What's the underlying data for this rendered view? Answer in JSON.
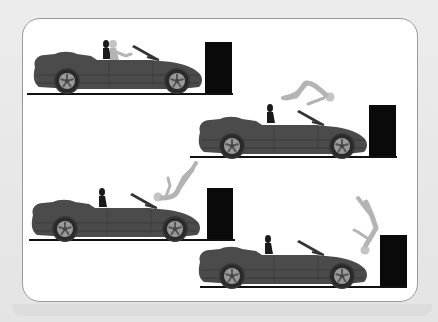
{
  "caption": {
    "text": " "
  },
  "illustration": {
    "description": "Four-frame sequence: convertible car crashes into wall, passenger is thrown over windshield into the wall",
    "colors": {
      "background": "#e8e8e8",
      "panel": "#ffffff",
      "panel_border": "#9a9a9a",
      "car_body": "#4a4a4a",
      "car_shadow": "#3a3a3a",
      "tire": "#2a2a2a",
      "rim": "#9a9a9a",
      "wall": "#0a0a0a",
      "ground": "#111111",
      "driver": "#1a1a1a",
      "passenger": "#b4b4b4",
      "windshield": "#333333"
    },
    "frames": [
      {
        "id": 1,
        "stage": "car-approaching-wall",
        "passenger_state": "seated"
      },
      {
        "id": 2,
        "stage": "impact-passenger-lunging",
        "passenger_state": "over-windshield"
      },
      {
        "id": 3,
        "stage": "passenger-flipping",
        "passenger_state": "inverted-over-hood"
      },
      {
        "id": 4,
        "stage": "passenger-hits-wall",
        "passenger_state": "head-down-at-wall"
      }
    ]
  }
}
